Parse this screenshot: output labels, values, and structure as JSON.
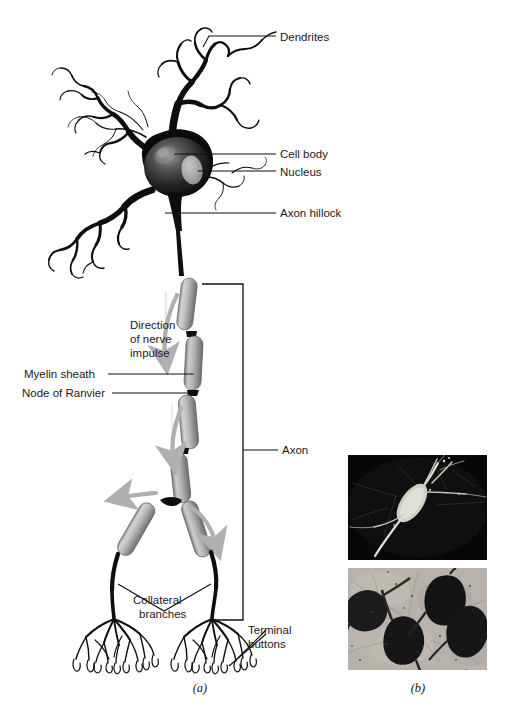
{
  "figure": {
    "panels": [
      {
        "id": "a",
        "label": "(a)",
        "caption_kind": "illustration"
      },
      {
        "id": "b",
        "label": "(b)",
        "caption_kind": "micrographs"
      }
    ]
  },
  "labels": {
    "dendrites": "Dendrites",
    "cell_body": "Cell body",
    "nucleus": "Nucleus",
    "axon_hillock": "Axon hillock",
    "direction_line1": "Direction",
    "direction_line2": "of nerve",
    "direction_line3": "impulse",
    "myelin_sheath": "Myelin sheath",
    "node_of_ranvier": "Node of Ranvier",
    "axon": "Axon",
    "collateral_line1": "Collateral",
    "collateral_line2": "branches",
    "terminal_line1": "Terminal",
    "terminal_line2": "buttons"
  },
  "panel_labels": {
    "a": "(a)",
    "b": "(b)"
  },
  "icons": {
    "impulse_arrow": "arrow-down-icon",
    "collateral_arrow_left": "arrow-left-icon",
    "collateral_arrow_right": "arrow-right-icon"
  },
  "colors": {
    "background": "#ffffff",
    "ink": "#111111",
    "soma_dark": "#0d0d0d",
    "soma_mid": "#3a3a3a",
    "soma_highlight": "#8c8c8c",
    "nucleus": "#a9a9a9",
    "myelin_light": "#cfcfcf",
    "myelin_mid": "#9a9a9a",
    "myelin_dark": "#6e6e6e",
    "arrow_gray": "#b4b4b4",
    "photo_top_bg": "#060606",
    "photo_top_cell": "#d8d8d0",
    "photo_bottom_bg": "#b8b4ad",
    "photo_bottom_cell": "#171717"
  },
  "photos": {
    "top": {
      "name": "darkfield-neuron-micrograph",
      "background": "dark",
      "description": "single bright neuron with dendrites on black background"
    },
    "bottom": {
      "name": "stained-tissue-micrograph",
      "background": "light",
      "description": "four dark stained pyramidal cell bodies in gray tissue"
    }
  }
}
